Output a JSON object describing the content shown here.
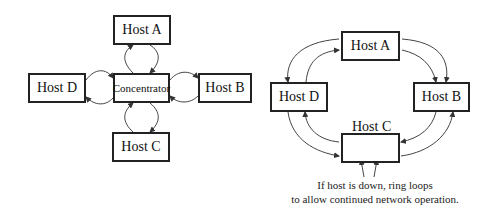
{
  "star": {
    "host_a": "Host A",
    "host_b": "Host B",
    "host_c": "Host C",
    "host_d": "Host D",
    "center": "Concentrator"
  },
  "ring": {
    "host_a": "Host A",
    "host_b": "Host B",
    "host_c": "Host C",
    "host_d": "Host D",
    "caption_line1": "If host is down, ring loops",
    "caption_line2": "to allow continued network operation."
  }
}
